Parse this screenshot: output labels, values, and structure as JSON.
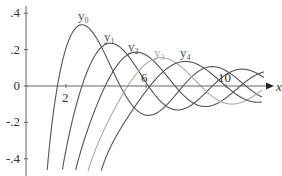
{
  "chart_data": {
    "type": "line",
    "title": "",
    "xlabel": "x",
    "ylabel": "",
    "xlim": [
      0,
      12.5
    ],
    "ylim": [
      -0.42,
      0.42
    ],
    "grid": false,
    "legend": "inline labels above curves",
    "x_ticks": [
      {
        "value": 2,
        "label": "2"
      },
      {
        "value": 6,
        "label": "6"
      },
      {
        "value": 10,
        "label": "10"
      }
    ],
    "y_ticks": [
      {
        "value": 0.4,
        "label": ".4"
      },
      {
        "value": 0.2,
        "label": ".2"
      },
      {
        "value": 0,
        "label": "0"
      },
      {
        "value": -0.2,
        "label": "-.2"
      },
      {
        "value": -0.4,
        "label": "-.4"
      }
    ],
    "x": [
      2,
      3,
      4,
      5,
      6,
      7,
      8,
      9,
      10,
      11,
      12
    ],
    "series": [
      {
        "name": "y0",
        "order": 0,
        "color": "#555555",
        "label_pos": [
          2.8,
          0.36
        ],
        "values": [
          0.208,
          0.33,
          0.163,
          -0.057,
          -0.16,
          -0.108,
          0.018,
          0.101,
          0.084,
          0.0,
          -0.07
        ]
      },
      {
        "name": "y1",
        "order": 1,
        "color": "#555555",
        "label_pos": [
          4.1,
          0.25
        ],
        "values": [
          -0.351,
          0.063,
          0.23,
          0.181,
          0.02,
          -0.109,
          -0.122,
          -0.035,
          0.063,
          0.091,
          0.039
        ]
      },
      {
        "name": "y2",
        "order": 2,
        "color": "#555555",
        "label_pos": [
          5.3,
          0.19
        ],
        "values": [
          -0.735,
          -0.267,
          0.01,
          0.166,
          0.17,
          0.061,
          -0.064,
          -0.113,
          -0.065,
          0.025,
          0.08
        ]
      },
      {
        "name": "y3",
        "order": 3,
        "color": "#aaaaaa",
        "label_pos": [
          6.6,
          0.16
        ],
        "values": [
          null,
          -0.508,
          -0.218,
          -0.015,
          0.122,
          0.153,
          0.082,
          -0.028,
          -0.096,
          -0.08,
          -0.006
        ]
      },
      {
        "name": "y4",
        "order": 4,
        "color": "#555555",
        "label_pos": [
          7.9,
          0.16
        ],
        "values": [
          null,
          null,
          -0.392,
          -0.187,
          -0.028,
          0.092,
          0.136,
          0.091,
          -0.002,
          -0.076,
          -0.084
        ]
      }
    ]
  }
}
